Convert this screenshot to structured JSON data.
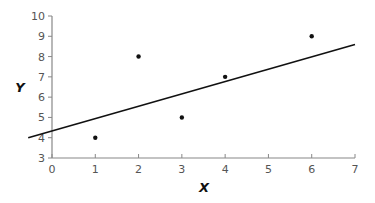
{
  "chart_data": {
    "type": "scatter",
    "title": "",
    "xlabel": "X",
    "ylabel": "Y",
    "xlim": [
      0,
      7
    ],
    "ylim": [
      3,
      10
    ],
    "xticks": [
      0,
      1,
      2,
      3,
      4,
      5,
      6,
      7
    ],
    "yticks": [
      3,
      4,
      5,
      6,
      7,
      8,
      9,
      10
    ],
    "grid": false,
    "legend": null,
    "points": [
      {
        "x": 1,
        "y": 4
      },
      {
        "x": 2,
        "y": 8
      },
      {
        "x": 3,
        "y": 5
      },
      {
        "x": 4,
        "y": 7
      },
      {
        "x": 6,
        "y": 9
      }
    ],
    "trend_line": {
      "x_start": -0.55,
      "y_start": 4.0,
      "x_end": 7,
      "y_end": 8.6
    },
    "colors": {
      "axis": "#888888",
      "point": "#111111",
      "line": "#111111",
      "tick_label": "#555555"
    }
  }
}
